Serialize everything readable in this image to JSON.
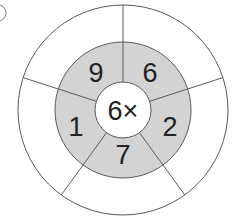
{
  "wheel": {
    "center_label": "6×",
    "inner_numbers": [
      "6",
      "2",
      "7",
      "1",
      "9"
    ],
    "outer_answers": [
      "",
      "",
      "",
      "",
      ""
    ],
    "colors": {
      "shade": "#d3d3d3",
      "line": "#5a5a5a",
      "text": "#222222",
      "background": "#ffffff"
    }
  },
  "corner_mark": ""
}
